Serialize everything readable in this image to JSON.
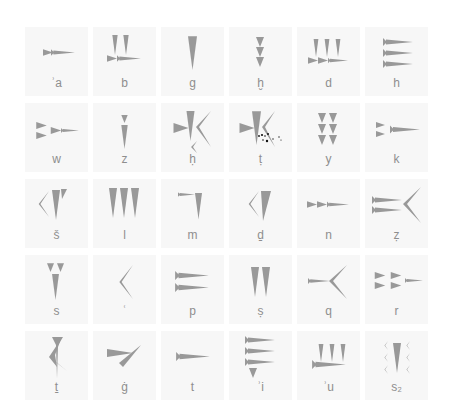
{
  "colors": {
    "background": "#ffffff",
    "tile": "#f7f7f7",
    "glyph": "#999999",
    "label": "#8e8e8e"
  },
  "letters": [
    {
      "label": "ʾa"
    },
    {
      "label": "b"
    },
    {
      "label": "g"
    },
    {
      "label": "ḫ"
    },
    {
      "label": "d"
    },
    {
      "label": "h"
    },
    {
      "label": "w"
    },
    {
      "label": "z"
    },
    {
      "label": "ḥ"
    },
    {
      "label": "ṭ"
    },
    {
      "label": "y"
    },
    {
      "label": "k"
    },
    {
      "label": "š"
    },
    {
      "label": "l"
    },
    {
      "label": "m"
    },
    {
      "label": "ḏ"
    },
    {
      "label": "n"
    },
    {
      "label": "ẓ"
    },
    {
      "label": "s"
    },
    {
      "label": "ʿ"
    },
    {
      "label": "p"
    },
    {
      "label": "ṣ"
    },
    {
      "label": "q"
    },
    {
      "label": "r"
    },
    {
      "label": "ṯ"
    },
    {
      "label": "ġ"
    },
    {
      "label": "t"
    },
    {
      "label": "ʾi"
    },
    {
      "label": "ʾu"
    },
    {
      "label": "s₂"
    }
  ]
}
